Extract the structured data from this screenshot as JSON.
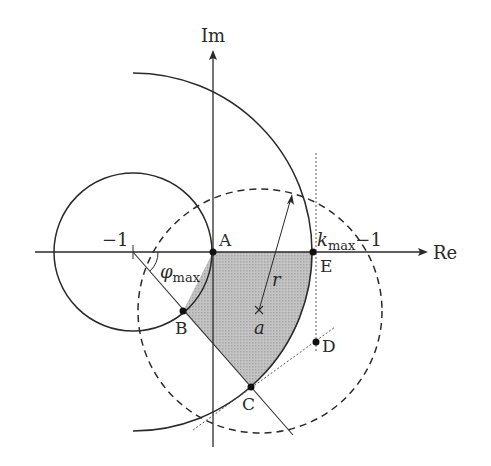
{
  "diagram": {
    "type": "complex-plane geometric construction (Nyquist region)",
    "axes": {
      "real_label": "Re",
      "imag_label": "Im"
    },
    "labels": {
      "minus_one": "−1",
      "phi": "φ",
      "phi_sub": "max",
      "k": "k",
      "k_sub": "max",
      "k_suffix": "−1",
      "r": "r",
      "a": "a"
    },
    "points": {
      "A": "A",
      "B": "B",
      "C": "C",
      "D": "D",
      "E": "E"
    },
    "colors": {
      "stroke": "#2a2a2a",
      "shaded_region": "#b4b4b4",
      "background": "#ffffff"
    },
    "elements": [
      "unit circle centered at −1 through origin A",
      "large arc of radius k_max centered at −1 through E",
      "dashed circle centered at a with radius r",
      "line from −1 at angle φ_max through B and C",
      "dotted vertical line through E and D",
      "dotted tangent line through C and D",
      "shaded region bounded by A, B, C, E"
    ]
  }
}
